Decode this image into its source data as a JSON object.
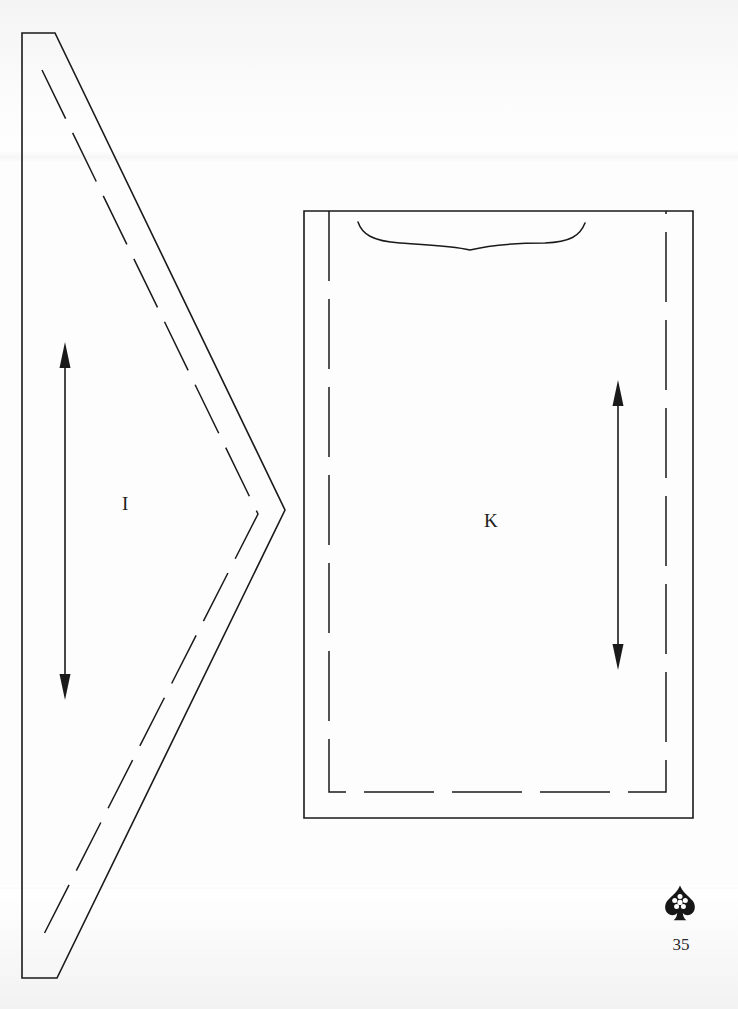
{
  "page": {
    "kind": "sewing-pattern-sheet",
    "background_color": "#ffffff",
    "ink_color": "#1a1a1a",
    "page_number": "35",
    "width": 738,
    "height": 1009
  },
  "logo": {
    "name": "spade-rosette-publisher-mark",
    "color": "#161616",
    "description": "Spade shaped emblem with white five-lobed rosette"
  },
  "pieces": [
    {
      "id": "I",
      "label": "I",
      "shape": "triangle",
      "label_x": 128,
      "label_y": 504,
      "cut_line": {
        "style": "solid",
        "points": [
          [
            22,
            33
          ],
          [
            55,
            33
          ],
          [
            285,
            510
          ],
          [
            57,
            978
          ],
          [
            22,
            978
          ]
        ]
      },
      "seam_line": {
        "style": "dashed",
        "points": [
          [
            42,
            70
          ],
          [
            258,
            514
          ],
          [
            42,
            938
          ]
        ]
      },
      "grainline": {
        "style": "double-arrow",
        "x": 65,
        "y_top": 344,
        "y_bottom": 698
      }
    },
    {
      "id": "K",
      "label": "K",
      "shape": "rectangle",
      "label_x": 490,
      "label_y": 521,
      "cut_line": {
        "style": "solid",
        "points": [
          [
            304,
            211
          ],
          [
            693,
            211
          ],
          [
            693,
            818
          ],
          [
            304,
            818
          ]
        ]
      },
      "seam_line": {
        "style": "dashed",
        "points": [
          [
            329,
            211
          ],
          [
            329,
            792
          ],
          [
            666,
            792
          ],
          [
            666,
            211
          ]
        ]
      },
      "neckline_curve": {
        "style": "solid",
        "start": [
          358,
          222
        ],
        "end": [
          585,
          223
        ],
        "dip_y": 243
      },
      "grainline": {
        "style": "double-arrow",
        "x": 618,
        "y_top": 382,
        "y_bottom": 668
      }
    }
  ]
}
